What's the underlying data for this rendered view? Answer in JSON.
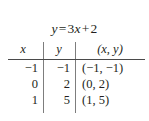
{
  "figure": {
    "title_equation": "y = 3x + 2",
    "equation_parts": {
      "lhs": "y",
      "equals": "=",
      "coefficient": "3",
      "variable": "x",
      "plus": "+",
      "constant": "2"
    }
  },
  "table": {
    "headers": {
      "x": "x",
      "y": "y",
      "pair": "(x, y)"
    },
    "rows": [
      {
        "x": "−1",
        "y": "−1",
        "pair": "(−1, −1)"
      },
      {
        "x": "0",
        "y": "2",
        "pair": "(0, 2)"
      },
      {
        "x": "1",
        "y": "5",
        "pair": "(1, 5)"
      }
    ]
  },
  "chart_data": {
    "type": "table",
    "columns": [
      "x",
      "y",
      "(x, y)"
    ],
    "x": [
      -1,
      0,
      1
    ],
    "values": [
      -1,
      2,
      5
    ],
    "points": [
      [
        -1,
        -1
      ],
      [
        0,
        2
      ],
      [
        1,
        5
      ]
    ],
    "rows": [
      [
        "-1",
        "-1",
        "(-1, -1)"
      ],
      [
        "0",
        "2",
        "(0, 2)"
      ],
      [
        "1",
        "5",
        "(1, 5)"
      ]
    ],
    "xlabel": "x",
    "ylabel": "y",
    "annotations": [
      "slope = 3",
      "intercept = 2"
    ],
    "grid": false,
    "legend": "none"
  },
  "colors": {
    "background": "#ffffff",
    "text": "#231f20",
    "rule": "#4a4a4a",
    "divider": "#7d7d7d"
  }
}
